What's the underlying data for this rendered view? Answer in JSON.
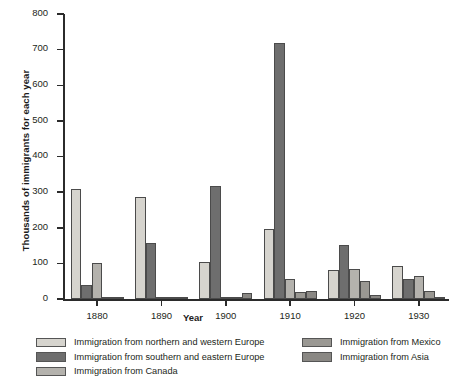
{
  "chart_data": {
    "type": "bar",
    "title": "",
    "xlabel": "Year",
    "ylabel": "Thousands of immigrants for each year",
    "categories": [
      "1880",
      "1890",
      "1900",
      "1910",
      "1920",
      "1930"
    ],
    "ylim": [
      0,
      800
    ],
    "yticks": [
      0,
      100,
      200,
      300,
      400,
      500,
      600,
      700,
      800
    ],
    "grid": false,
    "legend_position": "bottom",
    "series": [
      {
        "name": "Immigration from northern and western Europe",
        "color": "#d6d4ce",
        "values": [
          310,
          285,
          103,
          197,
          82,
          93
        ]
      },
      {
        "name": "Immigration from southern and eastern Europe",
        "color": "#6e6e6e",
        "values": [
          38,
          157,
          317,
          720,
          152,
          56
        ]
      },
      {
        "name": "Immigration from Canada",
        "color": "#b4b2ad",
        "values": [
          100,
          2,
          3,
          55,
          85,
          65
        ]
      },
      {
        "name": "Immigration from Mexico",
        "color": "#9a9893",
        "values": [
          2,
          1,
          2,
          20,
          50,
          22
        ]
      },
      {
        "name": "Immigration from Asia",
        "color": "#8a8884",
        "values": [
          6,
          2,
          18,
          22,
          12,
          3
        ]
      }
    ]
  },
  "legend": {
    "left_column": [
      "Immigration from northern and western Europe",
      "Immigration from southern and eastern Europe",
      "Immigration from Canada"
    ],
    "right_column": [
      "Immigration from Mexico",
      "Immigration from Asia"
    ]
  }
}
